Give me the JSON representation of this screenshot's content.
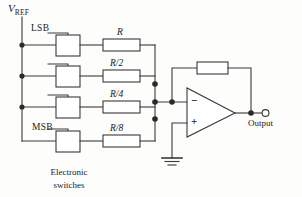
{
  "figure": {
    "type": "circuit-diagram",
    "background_color": "#fdfdfc",
    "line_color": "#3a3a3a"
  },
  "supply": {
    "label_main": "V",
    "label_sub": "REF"
  },
  "bits": {
    "lsb_label": "LSB",
    "msb_label": "MSB"
  },
  "switches": {
    "caption_line1": "Electronic",
    "caption_line2": "switches",
    "count": 4
  },
  "resistors": {
    "ladder": [
      {
        "label": "R"
      },
      {
        "label": "R/2"
      },
      {
        "label": "R/4"
      },
      {
        "label": "R/8"
      }
    ],
    "feedback": {
      "label": ""
    }
  },
  "opamp": {
    "inverting_pin": "−",
    "noninverting_pin": "+"
  },
  "output": {
    "label": "Output"
  }
}
